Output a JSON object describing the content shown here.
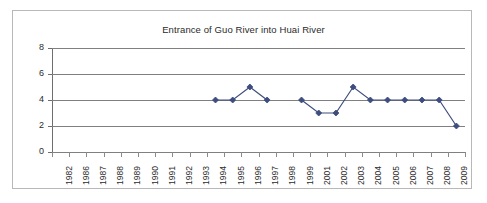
{
  "chart_data": {
    "type": "line",
    "title": "Entrance of Guo River into Huai River",
    "xlabel": "",
    "ylabel": "",
    "ylim": [
      0,
      8
    ],
    "yticks": [
      0,
      2,
      4,
      6,
      8
    ],
    "grid": true,
    "legend": false,
    "marker": "diamond",
    "series_color": "#3e4d7f",
    "categories": [
      "1982",
      "1986",
      "1987",
      "1988",
      "1989",
      "1990",
      "1991",
      "1992",
      "1993",
      "1994",
      "1995",
      "1996",
      "1997",
      "1998",
      "1999",
      "2001",
      "2002",
      "2003",
      "2004",
      "2005",
      "2006",
      "2007",
      "2008",
      "2009"
    ],
    "series": [
      {
        "name": "Entrance of Guo River into Huai River",
        "values": [
          null,
          null,
          null,
          null,
          null,
          null,
          null,
          null,
          null,
          4,
          4,
          5,
          4,
          null,
          4,
          3,
          3,
          5,
          4,
          4,
          4,
          4,
          4,
          2
        ]
      }
    ]
  },
  "colors": {
    "series": "#3e4d7f",
    "gridline": "#808080",
    "axis": "#6e6e6e",
    "frame": "#b8b8b8",
    "background": "#ffffff",
    "text": "#2b2b2b"
  }
}
